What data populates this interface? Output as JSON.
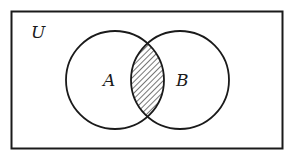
{
  "diagram": {
    "type": "venn",
    "universe_label": "U",
    "sets": [
      {
        "label": "A"
      },
      {
        "label": "B"
      }
    ],
    "shaded_region": "A ∩ B",
    "colors": {
      "stroke": "#1a1a1a",
      "background": "#ffffff",
      "hatch": "#1a1a1a"
    }
  }
}
